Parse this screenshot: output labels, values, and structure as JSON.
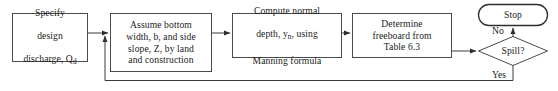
{
  "diagram": {
    "background_color": "#ffffff",
    "stroke_color": "#3a3a3a",
    "text_color": "#1a1a1a",
    "nodes": [
      {
        "id": "specify-discharge",
        "type": "process",
        "text_line_1": "Specify",
        "text_line_2": "design",
        "text_line_3a": "discharge, Q",
        "text_line_3b": "d"
      },
      {
        "id": "assume-bottom-width",
        "type": "process",
        "text": "Assume bottom\nwidth, b, and side\nslope, Z, by land\nand construction"
      },
      {
        "id": "compute-normal-depth",
        "type": "process",
        "text_line_1": "Compute normal",
        "text_line_2a": "depth, y",
        "text_line_2b": "n",
        "text_line_2c": ", using",
        "text_line_3": "Manning formula"
      },
      {
        "id": "determine-freeboard",
        "type": "process",
        "text": "Determine\nfreeboard from\nTable 6.3"
      },
      {
        "id": "spill-decision",
        "type": "decision",
        "text": "Spill?"
      },
      {
        "id": "stop-terminator",
        "type": "terminator",
        "text": "Stop"
      }
    ],
    "edge_labels": {
      "no": "No",
      "yes": "Yes"
    }
  }
}
